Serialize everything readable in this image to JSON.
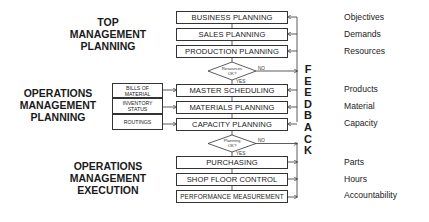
{
  "sections": {
    "top": [
      "TOP",
      "MANAGEMENT",
      "PLANNING"
    ],
    "ops_planning": [
      "OPERATIONS",
      "MANAGEMENT",
      "PLANNING"
    ],
    "ops_execution": [
      "OPERATIONS",
      "MANAGEMENT",
      "EXECUTION"
    ]
  },
  "process_boxes": [
    "BUSINESS PLANNING",
    "SALES PLANNING",
    "PRODUCTION PLANNING",
    "MASTER SCHEDULING",
    "MATERIALS PLANNING",
    "CAPACITY PLANNING",
    "PURCHASING",
    "SHOP FLOOR CONTROL",
    "PERFORMANCE MEASUREMENT"
  ],
  "inputs": [
    "BILLS OF MATERIAL",
    "INVENTORY STATUS",
    "ROUTINGS"
  ],
  "decisions": [
    {
      "label": "Resources OK?",
      "no": "NO",
      "yes": "YES"
    },
    {
      "label": "Planning OK?",
      "no": "NO",
      "yes": "YES"
    }
  ],
  "feedback_letters": [
    "F",
    "E",
    "E",
    "D",
    "B",
    "A",
    "C",
    "K"
  ],
  "outputs": [
    "Objectives",
    "Demands",
    "Resources",
    "Products",
    "Material",
    "Capacity",
    "Parts",
    "Hours",
    "Accountability"
  ]
}
